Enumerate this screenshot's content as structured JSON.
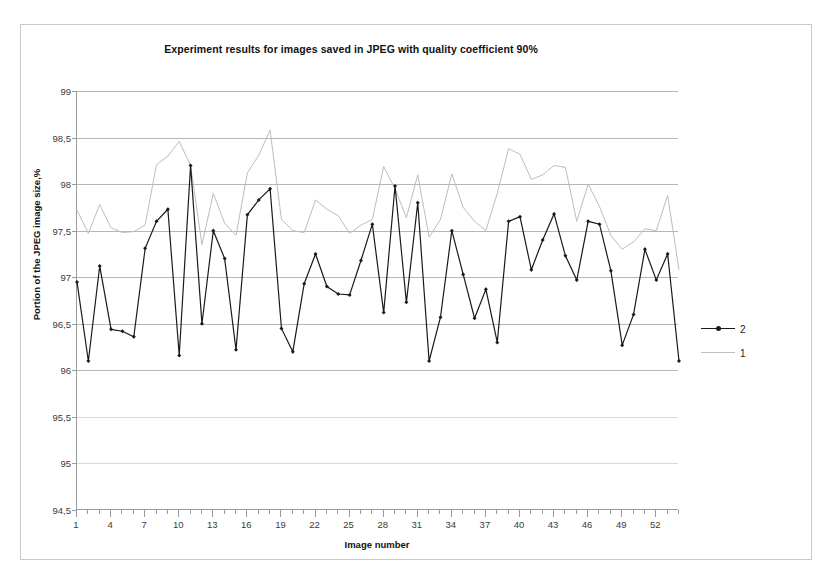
{
  "chart_data": {
    "type": "line",
    "title": "Experiment results for images saved in JPEG with quality coefficient 90%",
    "xlabel": "Image number",
    "ylabel": "Portion of the JPEG image size,%",
    "xlim": [
      1,
      54
    ],
    "ylim": [
      94.5,
      99
    ],
    "yticks": [
      94.5,
      95,
      95.5,
      96,
      96.5,
      97,
      97.5,
      98,
      98.5,
      99
    ],
    "ytick_labels": [
      "94,5",
      "95",
      "95,5",
      "96",
      "96,5",
      "97",
      "97,5",
      "98",
      "98,5",
      "99"
    ],
    "xticks": [
      1,
      4,
      7,
      10,
      13,
      16,
      19,
      22,
      25,
      28,
      31,
      34,
      37,
      40,
      43,
      46,
      49,
      52
    ],
    "xtick_labels": [
      "1",
      "4",
      "7",
      "10",
      "13",
      "16",
      "19",
      "22",
      "25",
      "28",
      "31",
      "34",
      "37",
      "40",
      "43",
      "46",
      "49",
      "52"
    ],
    "grid": true,
    "legend_position": "right",
    "x": [
      1,
      2,
      3,
      4,
      5,
      6,
      7,
      8,
      9,
      10,
      11,
      12,
      13,
      14,
      15,
      16,
      17,
      18,
      19,
      20,
      21,
      22,
      23,
      24,
      25,
      26,
      27,
      28,
      29,
      30,
      31,
      32,
      33,
      34,
      35,
      36,
      37,
      38,
      39,
      40,
      41,
      42,
      43,
      44,
      45,
      46,
      47,
      48,
      49,
      50,
      51,
      52,
      53,
      54
    ],
    "series": [
      {
        "name": "2",
        "color": "#1a1a1a",
        "marker": "diamond",
        "values": [
          96.95,
          96.1,
          97.12,
          96.44,
          96.42,
          96.36,
          97.31,
          97.6,
          97.73,
          96.16,
          98.2,
          96.5,
          97.5,
          97.2,
          96.22,
          97.67,
          97.83,
          97.95,
          96.45,
          96.2,
          96.93,
          97.25,
          96.9,
          96.82,
          96.81,
          97.18,
          97.57,
          96.62,
          97.98,
          96.73,
          97.8,
          96.1,
          96.57,
          97.5,
          97.03,
          96.56,
          96.87,
          96.3,
          97.6,
          97.65,
          97.08,
          97.4,
          97.68,
          97.23,
          96.97,
          97.6,
          97.57,
          97.07,
          96.27,
          96.6,
          97.3,
          96.97,
          97.25,
          96.1
        ]
      },
      {
        "name": "1",
        "color": "#bdbdbd",
        "marker": "none",
        "values": [
          97.72,
          97.47,
          97.78,
          97.53,
          97.48,
          97.49,
          97.56,
          98.21,
          98.3,
          98.46,
          98.2,
          97.35,
          97.9,
          97.58,
          97.45,
          98.12,
          98.31,
          98.58,
          97.62,
          97.5,
          97.48,
          97.83,
          97.73,
          97.66,
          97.47,
          97.56,
          97.62,
          98.19,
          97.95,
          97.64,
          98.1,
          97.43,
          97.62,
          98.11,
          97.75,
          97.6,
          97.5,
          97.9,
          98.38,
          98.32,
          98.05,
          98.1,
          98.2,
          98.18,
          97.6,
          98.0,
          97.76,
          97.45,
          97.3,
          97.38,
          97.52,
          97.5,
          97.88,
          97.08
        ]
      }
    ]
  },
  "legend": {
    "entries": [
      {
        "label": "2"
      },
      {
        "label": "1"
      }
    ]
  }
}
